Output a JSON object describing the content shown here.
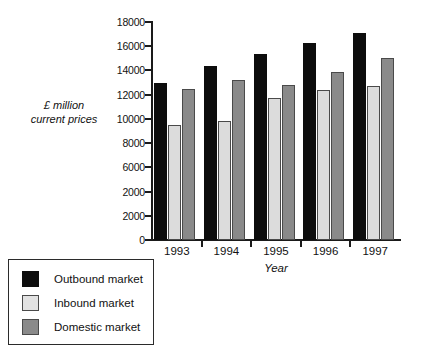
{
  "chart_data": {
    "type": "bar",
    "title": "",
    "xlabel": "Year",
    "ylabel": "£ million current prices",
    "categories": [
      "1993",
      "1994",
      "1995",
      "1996",
      "1997"
    ],
    "series": [
      {
        "name": "Outbound market",
        "color": "#0d0d0d",
        "values": [
          12950,
          14400,
          15400,
          16300,
          17100
        ]
      },
      {
        "name": "Inbound market",
        "color": "#dcdcdc",
        "values": [
          9500,
          9800,
          11750,
          12350,
          12750
        ]
      },
      {
        "name": "Domestic market",
        "color": "#8a8a8a",
        "values": [
          12450,
          13200,
          12800,
          13900,
          15050
        ]
      }
    ],
    "ylim": [
      0,
      18000
    ],
    "ytick_values": [
      0,
      2000,
      4000,
      6000,
      8000,
      10000,
      12000,
      14000,
      16000,
      18000
    ],
    "ytick_labels": [
      "0",
      "2000",
      "2000",
      "6000",
      "8000",
      "10000",
      "12000",
      "14000",
      "16000",
      "18000"
    ],
    "grid": false,
    "legend_position": "below-left"
  },
  "axes": {
    "y_title_line1": "£ million",
    "y_title_line2": "current prices",
    "x_title": "Year"
  },
  "legend": {
    "items": [
      {
        "label": "Outbound market"
      },
      {
        "label": "Inbound market"
      },
      {
        "label": "Domestic market"
      }
    ]
  }
}
